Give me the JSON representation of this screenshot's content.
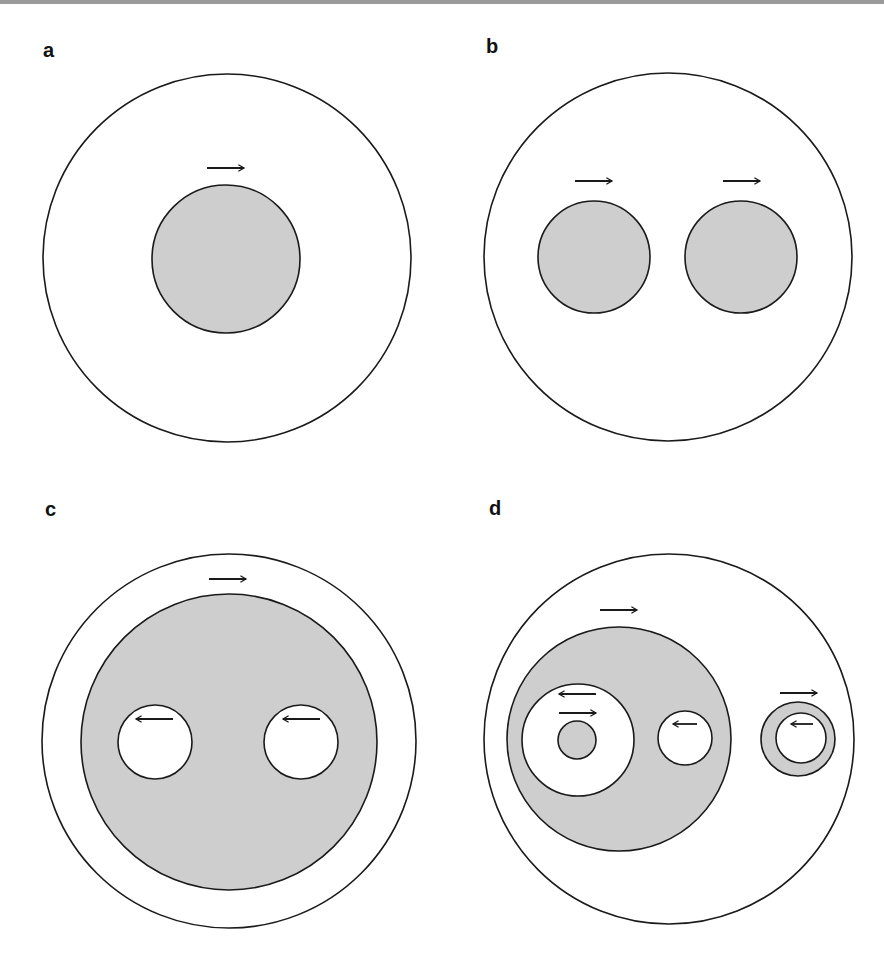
{
  "figure": {
    "colors": {
      "fill": "#cecece",
      "stroke": "#1a1a1a",
      "background": "#ffffff"
    },
    "panels": [
      {
        "label": "a",
        "description": "Single gray disk inside a large circle, arrow pointing right above the disk",
        "arrows": [
          "right"
        ]
      },
      {
        "label": "b",
        "description": "Two gray disks side by side inside a large circle, each with a right-pointing arrow",
        "arrows": [
          "right",
          "right"
        ]
      },
      {
        "label": "c",
        "description": "Large gray disk with two white holes, inside a large circle; right arrow above gray disk, left arrows in each hole",
        "arrows": [
          "right",
          "left",
          "left"
        ]
      },
      {
        "label": "d",
        "description": "Gray disk containing a large white hole (with a small gray disk inside) and a small white hole; separate gray ring with white hole on right",
        "arrows": [
          "right",
          "left",
          "right",
          "left",
          "right",
          "left"
        ]
      }
    ]
  }
}
